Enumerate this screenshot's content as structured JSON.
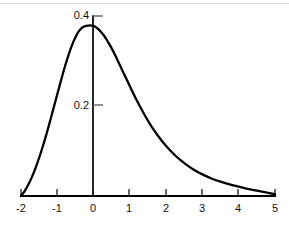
{
  "chart_data": {
    "type": "line",
    "title": "",
    "subtitle": "",
    "xlabel": "",
    "ylabel": "",
    "xlim": [
      -2,
      5
    ],
    "ylim": [
      0,
      0.42
    ],
    "grid": false,
    "legend": false,
    "legend_position": "none",
    "annotations": [],
    "x_ticks": [
      {
        "value": -2,
        "label": "-2"
      },
      {
        "value": -1,
        "label": "-1"
      },
      {
        "value": 0,
        "label": "0"
      },
      {
        "value": 1,
        "label": "1"
      },
      {
        "value": 2,
        "label": "2"
      },
      {
        "value": 3,
        "label": "3"
      },
      {
        "value": 4,
        "label": "4"
      },
      {
        "value": 5,
        "label": "5"
      }
    ],
    "y_ticks": [
      {
        "value": 0.2,
        "label": "0.2"
      },
      {
        "value": 0.4,
        "label": "0.4"
      }
    ],
    "series": [
      {
        "name": "density",
        "peak_x": 0,
        "peak_y": 0.378,
        "x": [
          -2.0,
          -1.9,
          -1.8,
          -1.7,
          -1.6,
          -1.5,
          -1.4,
          -1.3,
          -1.2,
          -1.1,
          -1.0,
          -0.9,
          -0.8,
          -0.7,
          -0.6,
          -0.5,
          -0.4,
          -0.3,
          -0.2,
          -0.1,
          0.0,
          0.1,
          0.2,
          0.3,
          0.4,
          0.5,
          0.6,
          0.7,
          0.8,
          0.9,
          1.0,
          1.2,
          1.4,
          1.6,
          1.8,
          2.0,
          2.25,
          2.5,
          2.75,
          3.0,
          3.25,
          3.5,
          3.75,
          4.0,
          4.25,
          4.5,
          4.75,
          5.0
        ],
        "values": [
          0.0,
          0.011,
          0.025,
          0.042,
          0.062,
          0.085,
          0.11,
          0.137,
          0.166,
          0.196,
          0.226,
          0.256,
          0.285,
          0.311,
          0.334,
          0.353,
          0.367,
          0.375,
          0.378,
          0.379,
          0.378,
          0.373,
          0.365,
          0.355,
          0.342,
          0.328,
          0.312,
          0.295,
          0.278,
          0.261,
          0.244,
          0.211,
          0.181,
          0.154,
          0.131,
          0.111,
          0.09,
          0.073,
          0.059,
          0.048,
          0.039,
          0.032,
          0.026,
          0.021,
          0.016,
          0.012,
          0.008,
          0.004
        ]
      }
    ]
  },
  "axes": {
    "x_axis_name": "horizontal-axis",
    "y_axis_name": "vertical-axis"
  }
}
